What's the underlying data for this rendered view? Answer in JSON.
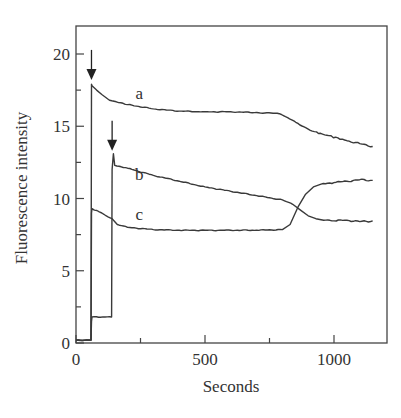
{
  "chart_data": {
    "type": "line",
    "title": "",
    "xlabel": "Seconds",
    "ylabel": "Fluorescence intensity",
    "xlim": [
      0,
      1200
    ],
    "ylim": [
      0,
      22
    ],
    "x_ticks": [
      0,
      500,
      1000
    ],
    "x_minor_ticks": [
      250,
      750
    ],
    "y_ticks": [
      0,
      5,
      10,
      15,
      20
    ],
    "y_minor_ticks": [
      2.5,
      7.5,
      12.5,
      17.5
    ],
    "x_tick_labels": [
      "0",
      "500",
      "1000"
    ],
    "y_tick_labels": [
      "0",
      "5",
      "10",
      "15",
      "20"
    ],
    "grid": false,
    "legend": "none (curves labeled inline)",
    "annotations": [
      {
        "type": "arrow",
        "x": 60,
        "y": 18.0,
        "note": "addition point for curve a"
      },
      {
        "type": "arrow",
        "x": 140,
        "y": 13.1,
        "note": "addition point for curve b"
      }
    ],
    "series": [
      {
        "name": "a",
        "label_pos": [
          245,
          16.9
        ],
        "x": [
          0,
          58,
          60,
          62,
          80,
          100,
          130,
          200,
          300,
          400,
          500,
          600,
          700,
          780,
          820,
          860,
          900,
          940,
          980,
          1050,
          1100,
          1150
        ],
        "y": [
          0.2,
          0.2,
          17.9,
          17.8,
          17.5,
          17.2,
          16.8,
          16.5,
          16.2,
          16.05,
          16.0,
          16.0,
          15.95,
          15.9,
          15.6,
          15.2,
          14.8,
          14.5,
          14.35,
          14.0,
          13.8,
          13.6
        ]
      },
      {
        "name": "b",
        "label_pos": [
          245,
          11.3
        ],
        "x": [
          0,
          58,
          60,
          62,
          138,
          140,
          145,
          150,
          200,
          300,
          400,
          500,
          600,
          700,
          800,
          840,
          870,
          900,
          930,
          960,
          1000,
          1050,
          1100,
          1150
        ],
        "y": [
          0.2,
          0.2,
          1.5,
          1.8,
          1.8,
          12.0,
          13.1,
          12.3,
          12.1,
          11.6,
          11.2,
          10.8,
          10.5,
          10.2,
          9.9,
          9.6,
          9.2,
          8.8,
          8.6,
          8.5,
          8.45,
          8.5,
          8.4,
          8.45
        ]
      },
      {
        "name": "c",
        "label_pos": [
          245,
          8.5
        ],
        "x": [
          0,
          58,
          60,
          62,
          100,
          140,
          160,
          200,
          300,
          400,
          500,
          600,
          700,
          800,
          830,
          860,
          890,
          920,
          950,
          1000,
          1050,
          1100,
          1150
        ],
        "y": [
          0.2,
          0.2,
          9.0,
          9.3,
          9.0,
          8.6,
          8.2,
          8.0,
          7.85,
          7.8,
          7.8,
          7.8,
          7.8,
          7.85,
          8.2,
          9.4,
          10.3,
          10.8,
          11.0,
          11.1,
          11.2,
          11.3,
          11.25
        ]
      }
    ]
  }
}
